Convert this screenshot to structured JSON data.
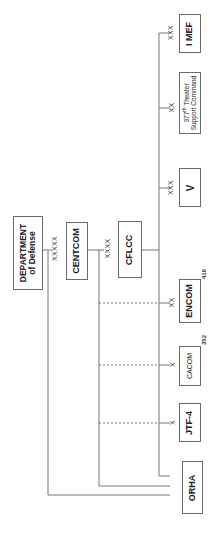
{
  "diagram": {
    "orientation": "rotated -90deg",
    "line_color": "#777777",
    "nodes": {
      "dod": {
        "line1": "DEPARTMENT",
        "line2": "of Defense"
      },
      "centcom": {
        "label": "CENTCOM",
        "echelon": "XXXXX"
      },
      "cflcc": {
        "label": "CFLCC",
        "echelon": "XXXX"
      },
      "imef": {
        "label": "I MEF",
        "echelon": "XXX"
      },
      "tsc377": {
        "line1_num": "377",
        "line1_sup": "th",
        "line1_rest": " Theater",
        "line2": "Support Command",
        "echelon": "XX"
      },
      "v": {
        "label": "V",
        "echelon": "XXX"
      },
      "encom": {
        "label": "ENCOM",
        "echelon": "XX",
        "number": "416"
      },
      "cacom": {
        "label": "CACOM",
        "echelon": "X",
        "number": "352"
      },
      "jtf4": {
        "label": "JTF-4",
        "echelon": "X"
      },
      "orha": {
        "label": "ORHA"
      }
    }
  }
}
